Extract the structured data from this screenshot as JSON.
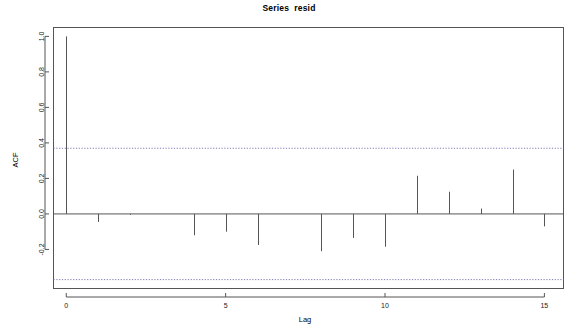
{
  "chart_data": {
    "type": "bar",
    "title": "Series  resid",
    "xlabel": "Lag",
    "ylabel": "ACF",
    "grid": false,
    "legend": "none",
    "x": [
      0,
      1,
      2,
      3,
      4,
      5,
      6,
      7,
      8,
      9,
      10,
      11,
      12,
      13,
      14,
      15
    ],
    "values": [
      1.0,
      -0.045,
      -0.005,
      0.0,
      -0.12,
      -0.1,
      -0.175,
      0.0,
      -0.21,
      -0.135,
      -0.185,
      0.215,
      0.125,
      0.03,
      0.25,
      -0.07
    ],
    "categories": [
      "0",
      "1",
      "2",
      "3",
      "4",
      "5",
      "6",
      "7",
      "8",
      "9",
      "10",
      "11",
      "12",
      "13",
      "14",
      "15"
    ],
    "xlim": [
      -0.4,
      15.6
    ],
    "ylim": [
      -0.42,
      1.05
    ],
    "xticks": [
      0,
      5,
      10,
      15
    ],
    "xtick_labels": [
      "0",
      "5",
      "10",
      "15"
    ],
    "yticks": [
      -0.2,
      0.0,
      0.2,
      0.4,
      0.6,
      0.8,
      1.0
    ],
    "ytick_labels": [
      "-0.2",
      "0.0",
      "0.2",
      "0.4",
      "0.6",
      "0.8",
      "1.0"
    ],
    "confidence_bands": {
      "upper": 0.37,
      "lower": -0.37,
      "style": "dashed",
      "color": "#7a7ab4"
    },
    "stem_color": "#555555",
    "frame_color": "#555555"
  },
  "figure": {
    "title": "Series  resid",
    "y_axis_title": "ACF",
    "x_axis_title": "Lag"
  }
}
